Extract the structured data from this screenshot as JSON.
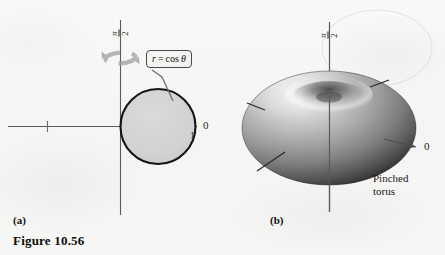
{
  "figure": {
    "number_label": "Figure 10.56",
    "panels": [
      {
        "id": "a",
        "caption": "(a)",
        "description": "Polar graph of the circle r = cos theta with revolution arrow about the vertical axis",
        "curve_label": {
          "r": "r",
          "equals": "=",
          "expr": "cos",
          "variable": "θ"
        },
        "axes": {
          "polar_axis_label": "0",
          "vertical_axis_label": {
            "numerator": "π",
            "denominator": "2"
          },
          "x_tick_label": "1"
        },
        "icons": {
          "revolve": "rotation-arrow-icon"
        },
        "colors": {
          "circle_fill": "#d2d2d2",
          "circle_stroke": "#111111",
          "axis": "#555555",
          "revolve_arrow": "#9a9a9a"
        }
      },
      {
        "id": "b",
        "caption": "(b)",
        "description": "Shaded 3-D pinched torus surface of revolution",
        "object_label_line1": "Pinched",
        "object_label_line2": "torus",
        "axes": {
          "polar_axis_label": "0",
          "vertical_axis_label": {
            "numerator": "π",
            "denominator": "2"
          }
        },
        "colors": {
          "surface_light": "#f0f0f0",
          "surface_mid": "#9a9a9a",
          "surface_dark": "#2a2a2a",
          "axis": "#555555"
        }
      }
    ]
  },
  "page": {
    "background": "#f6f6f4"
  }
}
